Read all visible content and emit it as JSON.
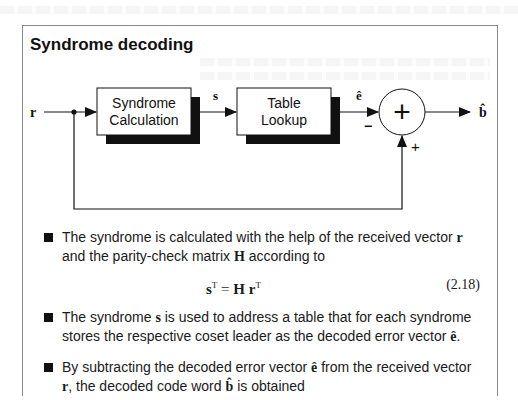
{
  "slide": {
    "title": "Syndrome decoding"
  },
  "diagram": {
    "input_label": "r",
    "block1": {
      "line1": "Syndrome",
      "line2": "Calculation"
    },
    "signal_s": "s",
    "block2": {
      "line1": "Table",
      "line2": "Lookup"
    },
    "signal_e_hat": "ê",
    "adder_symbol": "+",
    "minus_sign": "−",
    "plus_sign": "+",
    "output_label": "b̂"
  },
  "bullets": [
    {
      "pre": "The syndrome is calculated with the help of the received vector ",
      "v1": "r",
      "mid": " and the parity-check matrix ",
      "v2": "H",
      "post": " according to"
    },
    {
      "pre": "The syndrome ",
      "v1": "s",
      "mid": " is used to address a table that for each syndrome stores the respective coset leader as the decoded error vector ",
      "v2": "ê",
      "post": "."
    },
    {
      "pre": "By subtracting the decoded error vector ",
      "v1": "ê",
      "mid": " from the received vector ",
      "v2": "r",
      "post": ", the decoded code word ",
      "v3": "b̂",
      "post2": " is obtained"
    }
  ],
  "equation": {
    "lhs": "s",
    "lhs_sup": "T",
    "eq": " = ",
    "rhs_H": "H",
    "rhs_r": "r",
    "rhs_sup": "T",
    "number": "(2.18)"
  },
  "colors": {
    "ink": "#111111",
    "border": "#8a8a8a",
    "shadow": "#111111"
  }
}
